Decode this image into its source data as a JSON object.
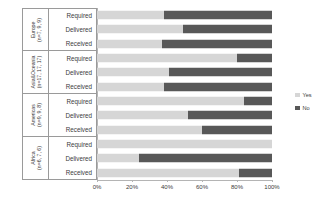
{
  "chart_data": {
    "type": "bar",
    "title": "",
    "xlabel": "",
    "ylabel": "",
    "orientation": "horizontal",
    "stacked": true,
    "normalized_percent": true,
    "xlim": [
      0,
      100
    ],
    "grid": false,
    "legend_position": "right",
    "tick_labels": [
      "0%",
      "20%",
      "40%",
      "60%",
      "80%",
      "100%"
    ],
    "tick_values": [
      0,
      20,
      40,
      60,
      80,
      100
    ],
    "series": [
      {
        "name": "Yes",
        "color": "#d6d6d6"
      },
      {
        "name": "No",
        "color": "#585858"
      }
    ],
    "groups": [
      {
        "name": "Europe",
        "counts": "(n=7, 9, 9)",
        "rows": [
          {
            "label": "Required",
            "yes": 38,
            "no": 62
          },
          {
            "label": "Delivered",
            "yes": 49,
            "no": 51
          },
          {
            "label": "Received",
            "yes": 37,
            "no": 63
          }
        ]
      },
      {
        "name": "Asia&Oceania",
        "counts": "(n=17, 17, 17)",
        "rows": [
          {
            "label": "Required",
            "yes": 80,
            "no": 20
          },
          {
            "label": "Delivered",
            "yes": 41,
            "no": 59
          },
          {
            "label": "Received",
            "yes": 38,
            "no": 62
          }
        ]
      },
      {
        "name": "Americas",
        "counts": "(n=9, 9, 8)",
        "rows": [
          {
            "label": "Required",
            "yes": 84,
            "no": 16
          },
          {
            "label": "Delivered",
            "yes": 52,
            "no": 48
          },
          {
            "label": "Received",
            "yes": 60,
            "no": 40
          }
        ]
      },
      {
        "name": "Africa",
        "counts": "(n=6, 7, 6)",
        "rows": [
          {
            "label": "Required",
            "yes": 100,
            "no": 0
          },
          {
            "label": "Delivered",
            "yes": 24,
            "no": 76
          },
          {
            "label": "Received",
            "yes": 81,
            "no": 19
          }
        ]
      }
    ]
  }
}
